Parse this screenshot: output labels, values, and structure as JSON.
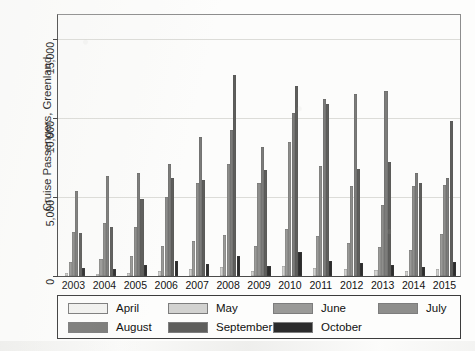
{
  "chart_data": {
    "type": "bar",
    "title": "",
    "xlabel": "",
    "ylabel": "Cruise Passengers, Greenland",
    "ylim": [
      0,
      16500
    ],
    "yticks": [
      0,
      5000,
      10000,
      15000
    ],
    "ytick_labels": [
      "0",
      "5,000",
      "10,000",
      "15,000"
    ],
    "grid": true,
    "legend_position": "bottom",
    "categories": [
      "2003",
      "2004",
      "2005",
      "2006",
      "2007",
      "2008",
      "2009",
      "2010",
      "2011",
      "2012",
      "2013",
      "2014",
      "2015"
    ],
    "series": [
      {
        "name": "April",
        "color": "#f2f2f0",
        "values": [
          0,
          0,
          0,
          0,
          0,
          0,
          0,
          0,
          0,
          0,
          0,
          0,
          0
        ]
      },
      {
        "name": "May",
        "color": "#d2d2d0",
        "values": [
          180,
          150,
          200,
          330,
          420,
          560,
          330,
          620,
          520,
          420,
          380,
          300,
          460
        ]
      },
      {
        "name": "June",
        "color": "#9a9a98",
        "values": [
          900,
          1050,
          1250,
          1900,
          2200,
          2600,
          1900,
          2950,
          2550,
          2100,
          1850,
          1650,
          2650
        ]
      },
      {
        "name": "July",
        "color": "#8e8e8c",
        "values": [
          2800,
          3350,
          3100,
          5000,
          5900,
          7050,
          5850,
          8500,
          6950,
          5700,
          4500,
          5700,
          5750
        ]
      },
      {
        "name": "August",
        "color": "#7c7c7a",
        "values": [
          5350,
          6350,
          6500,
          7050,
          8800,
          9200,
          8150,
          10300,
          11200,
          11500,
          11700,
          6500,
          6200
        ]
      },
      {
        "name": "September",
        "color": "#5e5e5c",
        "values": [
          2750,
          3100,
          4850,
          6200,
          6050,
          12700,
          6700,
          12000,
          10900,
          6750,
          7200,
          5850,
          9800
        ]
      },
      {
        "name": "October",
        "color": "#2c2c2c",
        "values": [
          520,
          430,
          700,
          950,
          760,
          1250,
          640,
          1500,
          980,
          820,
          700,
          600,
          860
        ]
      }
    ]
  },
  "legend": {
    "items": [
      {
        "label": "April",
        "color": "#f2f2f0"
      },
      {
        "label": "May",
        "color": "#d2d2d0"
      },
      {
        "label": "June",
        "color": "#9a9a98"
      },
      {
        "label": "July",
        "color": "#8e8e8c"
      },
      {
        "label": "August",
        "color": "#7c7c7a"
      },
      {
        "label": "September",
        "color": "#5e5e5c"
      },
      {
        "label": "October",
        "color": "#2c2c2c"
      }
    ]
  }
}
